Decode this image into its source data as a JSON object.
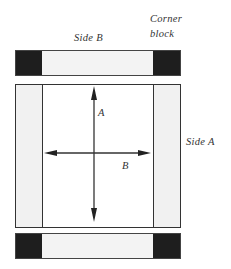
{
  "labels": {
    "side_b": "Side B",
    "corner_line1": "Corner",
    "corner_line2": "block",
    "side_a": "Side A",
    "arrow_a": "A",
    "arrow_b": "B"
  },
  "colors": {
    "corner_block": "#1e1e1e",
    "side_piece": "#f1f1f1",
    "outline": "#333333"
  }
}
